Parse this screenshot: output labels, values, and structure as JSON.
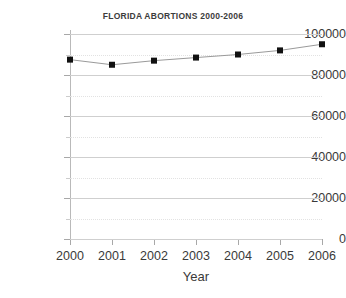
{
  "chart_data": {
    "type": "line",
    "title": "FLORIDA ABORTIONS 2000-2006",
    "xlabel": "Year",
    "ylabel": "",
    "categories": [
      "2000",
      "2001",
      "2002",
      "2003",
      "2004",
      "2005",
      "2006"
    ],
    "x": [
      2000,
      2001,
      2002,
      2003,
      2004,
      2005,
      2006
    ],
    "values": [
      87500,
      85000,
      87000,
      88500,
      90000,
      92000,
      95000
    ],
    "series": [
      {
        "name": "Florida abortions",
        "values": [
          87500,
          85000,
          87000,
          88500,
          90000,
          92000,
          95000
        ]
      }
    ],
    "xlim": [
      2000,
      2006
    ],
    "ylim": [
      0,
      100000
    ],
    "y_ticks": [
      0,
      20000,
      40000,
      60000,
      80000,
      100000
    ],
    "y_tick_labels": [
      "0",
      "20000",
      "40000",
      "60000",
      "80000",
      "100000"
    ],
    "y_minor_ticks": [
      10000,
      30000,
      50000,
      70000,
      90000
    ],
    "x_ticks": [
      2000,
      2001,
      2002,
      2003,
      2004,
      2005,
      2006
    ],
    "x_tick_labels": [
      "2000",
      "2001",
      "2002",
      "2003",
      "2004",
      "2005",
      "2006"
    ],
    "grid": {
      "major_horizontal": true,
      "minor_horizontal_dotted": true,
      "vertical": false
    },
    "legend": {
      "visible": false,
      "position": "none",
      "entries": []
    },
    "marker": "square",
    "colors": {
      "line": "#9a9a9a",
      "marker": "#111111",
      "grid_major": "#cfcfcf",
      "grid_minor": "#e2e2e2",
      "axis": "#b9b9b9",
      "text": "#3a3a3a",
      "background": "#ffffff"
    },
    "annotations": []
  }
}
